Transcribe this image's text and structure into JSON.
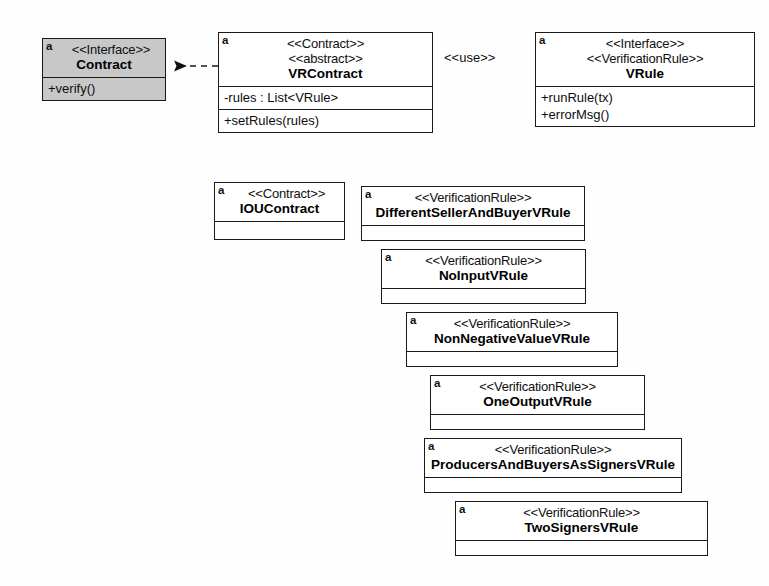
{
  "diagram": {
    "kind": "uml-class-diagram",
    "stroke_color": "#1a1a1a",
    "shaded_fill": "#c8c8c8",
    "artifact_marker": "a"
  },
  "classes": {
    "contract": {
      "marker": "a",
      "stereotypes": [
        "<<Interface>>"
      ],
      "name": "Contract",
      "attributes": [],
      "operations": [
        "+verify()"
      ],
      "shaded": true
    },
    "vrcontract": {
      "marker": "a",
      "stereotypes": [
        "<<Contract>>",
        "<<abstract>>"
      ],
      "name": "VRContract",
      "attributes": [
        "-rules : List<VRule>"
      ],
      "operations": [
        "+setRules(rules)"
      ],
      "shaded": false
    },
    "vrule": {
      "marker": "a",
      "stereotypes": [
        "<<Interface>>",
        "<<VerificationRule>>"
      ],
      "name": "VRule",
      "attributes": [],
      "operations": [
        "+runRule(tx)",
        "+errorMsg()"
      ],
      "shaded": false
    },
    "ioucontract": {
      "marker": "a",
      "stereotypes": [
        "<<Contract>>"
      ],
      "name": "IOUContract",
      "attributes": [],
      "operations": [],
      "shaded": false
    }
  },
  "rules": [
    {
      "marker": "a",
      "stereotype": "<<VerificationRule>>",
      "name": "DifferentSellerAndBuyerVRule"
    },
    {
      "marker": "a",
      "stereotype": "<<VerificationRule>>",
      "name": "NoInputVRule"
    },
    {
      "marker": "a",
      "stereotype": "<<VerificationRule>>",
      "name": "NonNegativeValueVRule"
    },
    {
      "marker": "a",
      "stereotype": "<<VerificationRule>>",
      "name": "OneOutputVRule"
    },
    {
      "marker": "a",
      "stereotype": "<<VerificationRule>>",
      "name": "ProducersAndBuyersAsSignersVRule"
    },
    {
      "marker": "a",
      "stereotype": "<<VerificationRule>>",
      "name": "TwoSignersVRule"
    }
  ],
  "relationships": {
    "use_label": "<<use>>",
    "vrcontract_realizes_contract": "dashed-closed-arrow",
    "vrcontract_uses_vrule": "dashed-open-arrow",
    "ioucontract_extends_vrcontract": "solid-hollow-triangle",
    "rules_realize_vrule": "dashed-closed-arrow",
    "ioucontract_associates_rules": "solid-line"
  }
}
